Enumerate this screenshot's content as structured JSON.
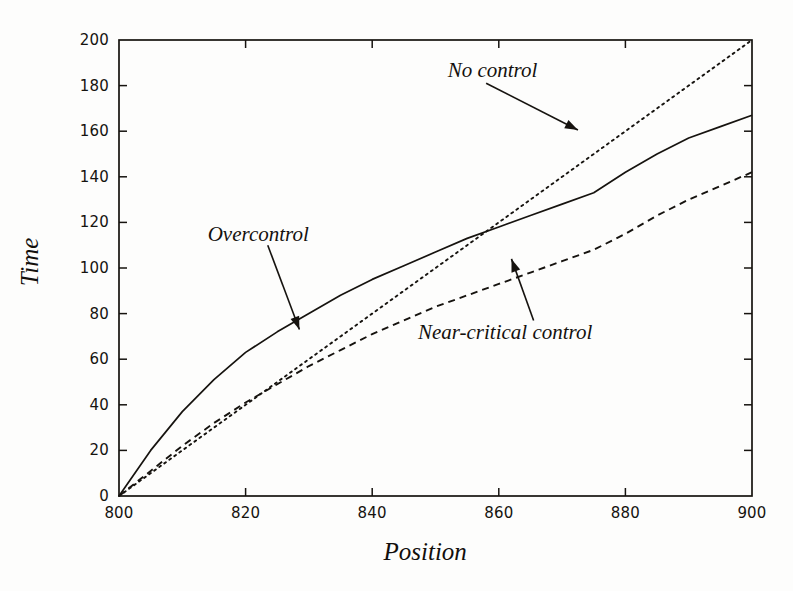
{
  "figure": {
    "background_color": "#fdfdfc",
    "ink_color": "#16130f"
  },
  "chart_data": {
    "type": "line",
    "title": "",
    "subtitle": "",
    "xlabel": "Position",
    "ylabel": "Time",
    "xlim": [
      800,
      900
    ],
    "ylim": [
      0,
      200
    ],
    "xticks": [
      800,
      820,
      840,
      860,
      880,
      900
    ],
    "xtick_labels": [
      "800",
      "820",
      "840",
      "860",
      "880",
      "900"
    ],
    "yticks": [
      0,
      20,
      40,
      60,
      80,
      100,
      120,
      140,
      160,
      180,
      200
    ],
    "ytick_labels": [
      "0",
      "20",
      "40",
      "60",
      "80",
      "100",
      "120",
      "140",
      "160",
      "180",
      "200"
    ],
    "grid": false,
    "legend_position": "none",
    "frame": "box",
    "tick_direction": "in",
    "x": [
      800,
      805,
      810,
      815,
      820,
      825,
      830,
      835,
      840,
      845,
      850,
      855,
      860,
      865,
      870,
      875,
      880,
      885,
      890,
      895,
      900
    ],
    "series": [
      {
        "name": "Overcontrol",
        "style": "solid",
        "color": "#16130f",
        "values": [
          0,
          20,
          37,
          51,
          63,
          72,
          80,
          88,
          95,
          101,
          107,
          113,
          118,
          123,
          128,
          133,
          142,
          150,
          157,
          162,
          167
        ]
      },
      {
        "name": "No control",
        "style": "dotted",
        "color": "#16130f",
        "values": [
          0,
          10,
          20,
          30,
          40,
          50,
          60,
          70,
          80,
          90,
          100,
          110,
          120,
          130,
          140,
          150,
          160,
          170,
          180,
          190,
          200
        ]
      },
      {
        "name": "Near-critical control",
        "style": "dashed",
        "color": "#16130f",
        "values": [
          0,
          11,
          22,
          32,
          41,
          49,
          57,
          64,
          71,
          77,
          83,
          88,
          93,
          98,
          103,
          108,
          115,
          123,
          130,
          136,
          142
        ]
      }
    ],
    "annotations": [
      {
        "text": "No control",
        "target_series": "No control",
        "label_x": 859,
        "label_y": 186,
        "arrow_from": [
          858,
          181
        ],
        "arrow_to": [
          872.5,
          160.5
        ]
      },
      {
        "text": "Overcontrol",
        "target_series": "Overcontrol",
        "label_x": 822,
        "label_y": 114,
        "arrow_from": [
          823.5,
          110
        ],
        "arrow_to": [
          828.5,
          73
        ]
      },
      {
        "text": "Near-critical control",
        "target_series": "Near-critical control",
        "label_x": 861,
        "label_y": 71,
        "arrow_from": [
          865.5,
          77
        ],
        "arrow_to": [
          862,
          104
        ]
      }
    ]
  }
}
